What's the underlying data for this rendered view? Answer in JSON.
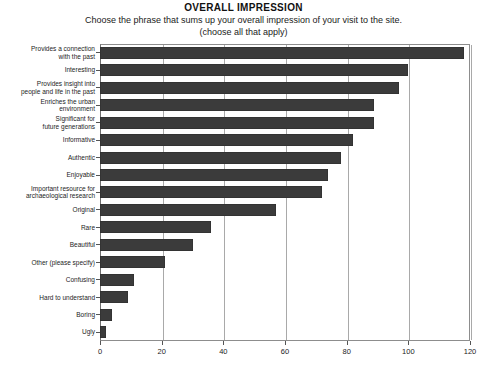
{
  "chart_data": {
    "type": "bar",
    "orientation": "horizontal",
    "title": "OVERALL IMPRESSION",
    "subtitle": "Choose the phrase that sums up your overall impression of your visit to the site.",
    "subtitle2": "(choose all that apply)",
    "xlabel": "",
    "ylabel": "",
    "xlim": [
      0,
      120
    ],
    "xticks": [
      0,
      20,
      40,
      60,
      80,
      100,
      120
    ],
    "xtick_labels": [
      "0",
      "20",
      "40",
      "60",
      "80",
      "100",
      "120"
    ],
    "grid": true,
    "grid_axis": "x",
    "legend": false,
    "bar_color": "#3b3b3b",
    "categories": [
      "Provides a connection\nwith the past",
      "Interesting",
      "Provides insight into\npeople and life in the past",
      "Enriches the urban\nenvironment",
      "Significant for\nfuture generations",
      "Informative",
      "Authentic",
      "Enjoyable",
      "Important resource for\narchaeological research",
      "Original",
      "Rare",
      "Beautiful",
      "Other (please specify)",
      "Confusing",
      "Hard to understand",
      "Boring",
      "Ugly"
    ],
    "values": [
      118,
      100,
      97,
      89,
      89,
      82,
      78,
      74,
      72,
      57,
      36,
      30,
      21,
      11,
      9,
      4,
      2
    ]
  }
}
